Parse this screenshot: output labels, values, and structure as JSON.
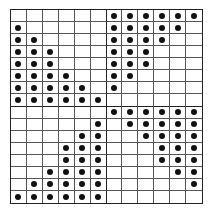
{
  "diagram": {
    "type": "dot-grid",
    "columns": 12,
    "rows": 16,
    "quadrant_cols": 6,
    "quadrant_rows": 8,
    "colors": {
      "line": "#555555",
      "divider": "#222222",
      "dot": "#111111",
      "background": "#ffffff"
    },
    "quadrants": {
      "top_left": [
        [
          0,
          0,
          0,
          0,
          0,
          0
        ],
        [
          1,
          0,
          0,
          0,
          0,
          0
        ],
        [
          1,
          1,
          0,
          0,
          0,
          0
        ],
        [
          1,
          1,
          1,
          0,
          0,
          0
        ],
        [
          1,
          1,
          1,
          0,
          0,
          0
        ],
        [
          1,
          1,
          1,
          1,
          0,
          0
        ],
        [
          1,
          1,
          1,
          1,
          1,
          0
        ],
        [
          1,
          1,
          1,
          1,
          1,
          1
        ]
      ],
      "top_right": [
        [
          1,
          1,
          1,
          1,
          1,
          1
        ],
        [
          1,
          1,
          1,
          1,
          1,
          0
        ],
        [
          1,
          1,
          1,
          1,
          0,
          0
        ],
        [
          1,
          1,
          1,
          0,
          0,
          0
        ],
        [
          1,
          1,
          1,
          0,
          0,
          0
        ],
        [
          1,
          1,
          0,
          0,
          0,
          0
        ],
        [
          1,
          0,
          0,
          0,
          0,
          0
        ],
        [
          0,
          0,
          0,
          0,
          0,
          0
        ]
      ],
      "bottom_left": [
        [
          0,
          0,
          0,
          0,
          0,
          0
        ],
        [
          0,
          0,
          0,
          0,
          0,
          1
        ],
        [
          0,
          0,
          0,
          0,
          1,
          1
        ],
        [
          0,
          0,
          0,
          1,
          1,
          1
        ],
        [
          0,
          0,
          0,
          1,
          1,
          1
        ],
        [
          0,
          0,
          1,
          1,
          1,
          1
        ],
        [
          0,
          1,
          1,
          1,
          1,
          1
        ],
        [
          1,
          1,
          1,
          1,
          1,
          1
        ]
      ],
      "bottom_right": [
        [
          1,
          1,
          1,
          1,
          1,
          1
        ],
        [
          0,
          1,
          1,
          1,
          1,
          1
        ],
        [
          0,
          0,
          1,
          1,
          1,
          1
        ],
        [
          0,
          0,
          0,
          1,
          1,
          1
        ],
        [
          0,
          0,
          0,
          1,
          1,
          1
        ],
        [
          0,
          0,
          0,
          0,
          1,
          1
        ],
        [
          0,
          0,
          0,
          0,
          0,
          1
        ],
        [
          0,
          0,
          0,
          0,
          0,
          0
        ]
      ]
    }
  }
}
